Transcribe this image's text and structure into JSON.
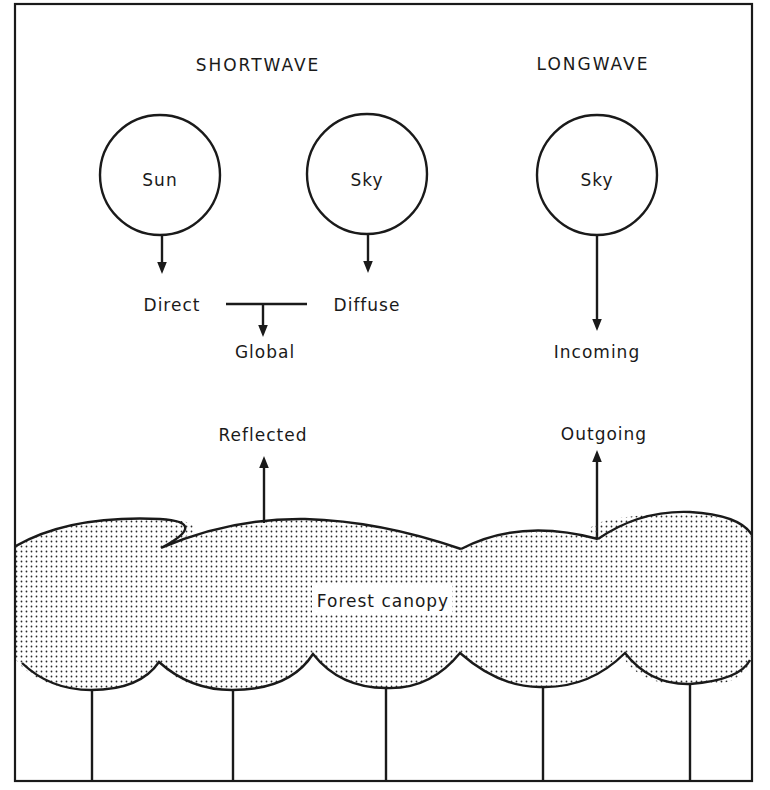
{
  "diagram": {
    "sections": {
      "shortwave": {
        "label": "SHORTWAVE"
      },
      "longwave": {
        "label": "LONGWAVE"
      }
    },
    "sources": [
      {
        "id": "sun",
        "label": "Sun",
        "group": "shortwave"
      },
      {
        "id": "sky_sw",
        "label": "Sky",
        "group": "shortwave"
      },
      {
        "id": "sky_lw",
        "label": "Sky",
        "group": "longwave"
      }
    ],
    "fluxes": {
      "direct": "Direct",
      "diffuse": "Diffuse",
      "global": "Global",
      "incoming": "Incoming",
      "reflected": "Reflected",
      "outgoing": "Outgoing"
    },
    "canopy": {
      "label": "Forest canopy",
      "crowns": 5,
      "trunks": 5
    },
    "edges": [
      {
        "from": "Sun",
        "to": "Direct",
        "direction": "down"
      },
      {
        "from": "Sky",
        "to": "Diffuse",
        "direction": "down"
      },
      {
        "from": "Direct + Diffuse",
        "to": "Global",
        "direction": "down"
      },
      {
        "from": "Sky (longwave)",
        "to": "Incoming",
        "direction": "down"
      },
      {
        "from": "Forest canopy",
        "to": "Reflected",
        "direction": "up"
      },
      {
        "from": "Forest canopy",
        "to": "Outgoing",
        "direction": "up"
      }
    ],
    "colors": {
      "ink": "#1a1a1a",
      "background": "#ffffff"
    }
  }
}
